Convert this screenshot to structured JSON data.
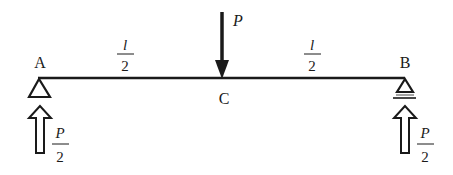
{
  "diagram": {
    "type": "simply-supported-beam",
    "colors": {
      "ink": "#1a1a1a",
      "background": "#ffffff"
    },
    "points": {
      "A": {
        "label": "A"
      },
      "B": {
        "label": "B"
      },
      "C": {
        "label": "C"
      }
    },
    "load": {
      "label": "P",
      "direction": "down"
    },
    "spans": [
      {
        "numerator": "l",
        "denominator": "2"
      },
      {
        "numerator": "l",
        "denominator": "2"
      }
    ],
    "reactions": [
      {
        "support": "A",
        "numerator": "P",
        "denominator": "2",
        "direction": "up"
      },
      {
        "support": "B",
        "numerator": "P",
        "denominator": "2",
        "direction": "up"
      }
    ],
    "supports": [
      {
        "at": "A",
        "kind": "pin-triangle"
      },
      {
        "at": "B",
        "kind": "roller-triangle"
      }
    ]
  }
}
